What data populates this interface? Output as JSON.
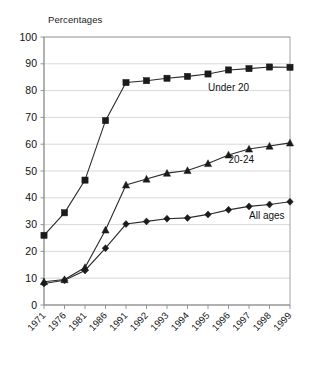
{
  "chart_data": {
    "type": "line",
    "title": "",
    "ylabel": "Percentages",
    "xlabel": "",
    "ylim": [
      0,
      100
    ],
    "ytick_step": 10,
    "yticks": [
      0,
      10,
      20,
      30,
      40,
      50,
      60,
      70,
      80,
      90,
      100
    ],
    "grid": true,
    "legend_position": "inline-right",
    "categories": [
      "1971",
      "1976",
      "1981",
      "1986",
      "1991",
      "1992",
      "1993",
      "1994",
      "1995",
      "1996",
      "1997",
      "1998",
      "1999"
    ],
    "series": [
      {
        "name": "Under 20",
        "marker": "square",
        "values": [
          26,
          34.4,
          46.6,
          68.8,
          83,
          83.7,
          84.6,
          85.3,
          86.2,
          87.7,
          88.2,
          88.8,
          88.7
        ]
      },
      {
        "name": "20-24",
        "marker": "triangle",
        "values": [
          8.7,
          9.5,
          14,
          28,
          44.8,
          47,
          49.2,
          50.2,
          52.8,
          56,
          58.2,
          59.3,
          60.5
        ]
      },
      {
        "name": "All ages",
        "marker": "diamond",
        "values": [
          8,
          9.2,
          12.9,
          21.2,
          30.2,
          31.2,
          32.2,
          32.5,
          33.8,
          35.5,
          36.8,
          37.5,
          38.5
        ]
      }
    ],
    "annotations": [
      {
        "text": "Under 20",
        "x_category": "1995",
        "value": 80
      },
      {
        "text": "20-24",
        "x_category": "1996",
        "value": 53
      },
      {
        "text": "All ages",
        "x_category": "1997",
        "value": 32
      }
    ],
    "colors": {
      "line": "#2b2b2b",
      "marker": "#1b1b1b",
      "grid": "#c9c9c9",
      "axis": "#8a8a8a",
      "background": "#ffffff"
    }
  }
}
